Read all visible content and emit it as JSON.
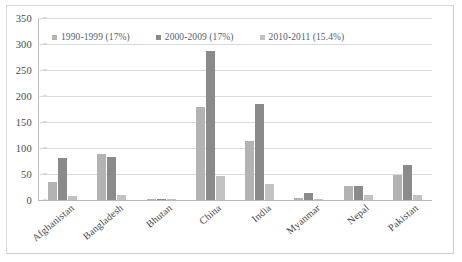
{
  "chart_data": {
    "type": "bar",
    "title": "",
    "xlabel": "",
    "ylabel": "",
    "ylim": [
      0,
      350
    ],
    "ytick_step": 50,
    "yticks": [
      0,
      50,
      100,
      150,
      200,
      250,
      300,
      350
    ],
    "grid": true,
    "legend_position": "top-inside",
    "categories": [
      "Afghanistan",
      "Bangladesh",
      "Bhutan",
      "China",
      "India",
      "Myanmar",
      "Nepal",
      "Pakistan"
    ],
    "series": [
      {
        "name": "1990-1999 (17%)",
        "color": "#b3b3b3",
        "values": [
          35,
          89,
          1,
          178,
          113,
          3,
          26,
          48
        ]
      },
      {
        "name": "2000-2009 (17%)",
        "color": "#8a8a8a",
        "values": [
          80,
          82,
          2,
          287,
          185,
          13,
          27,
          67
        ]
      },
      {
        "name": "2010-2011 (15.4%)",
        "color": "#c2c2c2",
        "values": [
          7,
          9,
          1,
          46,
          31,
          1,
          10,
          9
        ]
      }
    ]
  },
  "colors": {
    "gridline": "#d9d9d9",
    "axis": "#bdbdbd",
    "tick_text": "#4a4a4a",
    "category_text": "#3d3d3d",
    "legend_text": "#54616e",
    "frame": "#d8d8d8",
    "background": "#ffffff"
  }
}
